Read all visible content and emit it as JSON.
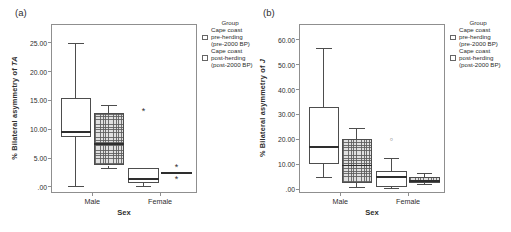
{
  "legend": {
    "title": "Group",
    "entries": [
      {
        "style": "pre",
        "lines": [
          "Cape coast",
          "pre-herding",
          "(pre-2000 BP)"
        ]
      },
      {
        "style": "post",
        "lines": [
          "Cape coast",
          "post-herding",
          "(post-2000 BP)"
        ]
      }
    ]
  },
  "colors": {
    "text": "#2e2e2e",
    "axis": "#8f8f8f",
    "box_outline": "#4d4d4d",
    "hatch_fill": "#e0e0e0",
    "pre_fill": "#ffffff"
  },
  "chart_data": [
    {
      "type": "boxplot",
      "panel_label": "(a)",
      "ylabel_prefix": "% Bilateral asymmetry of ",
      "ylabel_var": "TA",
      "xlabel": "Sex",
      "categories": [
        "Male",
        "Female"
      ],
      "ylim": [
        -0.9,
        28.1
      ],
      "grid": false,
      "legend_position": "right",
      "yticks": [
        {
          "v": 0,
          "label": ".00"
        },
        {
          "v": 5,
          "label": "5.00"
        },
        {
          "v": 10,
          "label": "10.00"
        },
        {
          "v": 15,
          "label": "15.00"
        },
        {
          "v": 20,
          "label": "20.00"
        },
        {
          "v": 25,
          "label": "25.00"
        }
      ],
      "groups": [
        {
          "name": "Cape coast pre-herding (pre-2000 BP)",
          "style": "pre",
          "boxes": [
            {
              "category": "Male",
              "whislo": 0.1,
              "q1": 8.7,
              "med": 9.5,
              "q3": 15.5,
              "whishi": 24.9,
              "outliers": []
            },
            {
              "category": "Female",
              "whislo": 0.1,
              "q1": 0.6,
              "med": 1.4,
              "q3": 3.2,
              "whishi": 3.2,
              "outliers": [
                {
                  "v": 13.3,
                  "kind": "extreme"
                }
              ]
            }
          ]
        },
        {
          "name": "Cape coast post-herding (post-2000 BP)",
          "style": "post",
          "boxes": [
            {
              "category": "Male",
              "whislo": 3.2,
              "q1": 3.7,
              "med": 7.4,
              "q3": 12.8,
              "whishi": 14.2,
              "outliers": []
            },
            {
              "category": "Female",
              "whislo": 2.2,
              "q1": 2.2,
              "med": 2.35,
              "q3": 2.55,
              "whishi": 2.55,
              "outliers": [
                {
                  "v": 3.6,
                  "kind": "extreme"
                },
                {
                  "v": 1.5,
                  "kind": "extreme"
                }
              ]
            }
          ]
        }
      ]
    },
    {
      "type": "boxplot",
      "panel_label": "(b)",
      "ylabel_prefix": "% Bilateral asymmetry of ",
      "ylabel_var": "J",
      "xlabel": "Sex",
      "categories": [
        "Male",
        "Female"
      ],
      "ylim": [
        -1.2,
        66
      ],
      "grid": false,
      "legend_position": "right",
      "yticks": [
        {
          "v": 0,
          "label": ".00"
        },
        {
          "v": 10,
          "label": "10.00"
        },
        {
          "v": 20,
          "label": "20.00"
        },
        {
          "v": 30,
          "label": "30.00"
        },
        {
          "v": 40,
          "label": "40.00"
        },
        {
          "v": 50,
          "label": "50.00"
        },
        {
          "v": 60,
          "label": "60.00"
        }
      ],
      "groups": [
        {
          "name": "Cape coast pre-herding (pre-2000 BP)",
          "style": "pre",
          "boxes": [
            {
              "category": "Male",
              "whislo": 4.8,
              "q1": 10.0,
              "med": 17.0,
              "q3": 33.0,
              "whishi": 56.5,
              "outliers": []
            },
            {
              "category": "Female",
              "whislo": 0.3,
              "q1": 0.8,
              "med": 4.8,
              "q3": 7.3,
              "whishi": 12.3,
              "outliers": [
                {
                  "v": 19.8,
                  "kind": "mild"
                }
              ]
            }
          ]
        },
        {
          "name": "Cape coast post-herding (post-2000 BP)",
          "style": "post",
          "boxes": [
            {
              "category": "Male",
              "whislo": 0.8,
              "q1": 2.3,
              "med": 9.5,
              "q3": 20.0,
              "whishi": 24.5,
              "outliers": []
            },
            {
              "category": "Female",
              "whislo": 1.8,
              "q1": 2.6,
              "med": 3.2,
              "q3": 5.0,
              "whishi": 6.3,
              "outliers": []
            }
          ]
        }
      ]
    }
  ]
}
